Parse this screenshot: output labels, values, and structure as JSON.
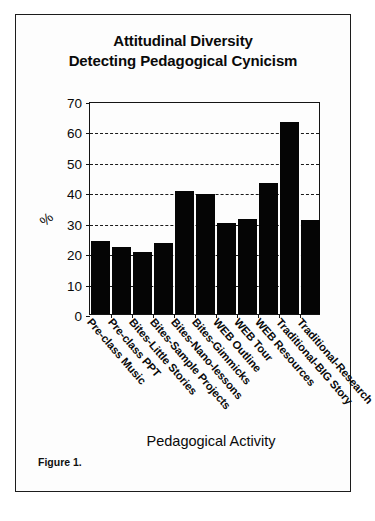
{
  "figure": {
    "caption": "Figure 1."
  },
  "chart_data": {
    "type": "bar",
    "title": "Attitudinal Diversity\nDetecting Pedagogical Cynicism",
    "title_lines": [
      "Attitudinal Diversity",
      "Detecting Pedagogical Cynicism"
    ],
    "xlabel": "Pedagogical Activity",
    "ylabel": "%",
    "ylim": [
      0,
      70
    ],
    "yticks": [
      0,
      10,
      20,
      30,
      40,
      50,
      60,
      70
    ],
    "ytick_labels": [
      "0",
      "10",
      "20",
      "30",
      "40",
      "50",
      "60",
      "70"
    ],
    "grid": true,
    "grid_axis": "y",
    "grid_style": "dashed",
    "legend": false,
    "bar_color": "#050505",
    "categories": [
      "Pre-class Music",
      "Pre-class PPT",
      "Bites-Little Stories",
      "Bites-Sample Projects",
      "Bites-Nano-lessons",
      "Bites-Gimmicks",
      "WEB Outline",
      "WEB Tour",
      "WEB Resources",
      "Traditional-BIG Story",
      "Traditional-Research"
    ],
    "values": [
      24,
      22,
      20.5,
      23.5,
      40.5,
      39.5,
      29.8,
      31.2,
      43.2,
      63,
      31
    ]
  }
}
